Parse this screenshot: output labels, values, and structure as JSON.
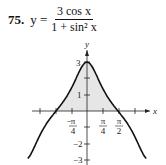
{
  "problem": {
    "number": "75.",
    "lhs": "y =",
    "numerator": "3 cos x",
    "denominator": "1 + sin² x"
  },
  "chart_data": {
    "type": "line",
    "xlabel": "x",
    "ylabel": "y",
    "x_ticks": [
      "-π/4",
      "π/4",
      "π/2"
    ],
    "y_ticks": [
      "3",
      "1",
      "-2",
      "-3"
    ],
    "xlim": [
      -3.5,
      3.5
    ],
    "ylim": [
      -3.3,
      3.5
    ],
    "shaded_region": "between curve and x-axis from -π/2 to π/2",
    "grid": false
  }
}
